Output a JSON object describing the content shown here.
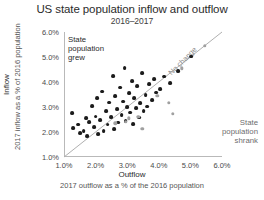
{
  "chart_data": {
    "type": "scatter",
    "title": "US state population inflow and outflow",
    "subtitle": "2016–2017",
    "xlabel": "Outflow",
    "xlabel_sub": "2017 outflow as a % of the 2016 population",
    "ylabel": "Inflow",
    "ylabel_sub": "2017 inflow as a % of 2016 population",
    "xlim": [
      1.0,
      6.0
    ],
    "ylim": [
      1.0,
      6.0
    ],
    "xticks": [
      "1.0%",
      "2.0%",
      "3.0%",
      "4.0%",
      "5.0%",
      "6.0%"
    ],
    "yticks": [
      "1.0%",
      "2.0%",
      "3.0%",
      "4.0%",
      "5.0%",
      "6.0%"
    ],
    "xtick_values": [
      1.0,
      2.0,
      3.0,
      4.0,
      5.0,
      6.0
    ],
    "ytick_values": [
      1.0,
      2.0,
      3.0,
      4.0,
      5.0,
      6.0
    ],
    "grid": false,
    "legend": "none",
    "annotations": [
      {
        "name": "grew",
        "text": "State\npopulation\ngrew",
        "position": "upper-left"
      },
      {
        "name": "shrank",
        "text": "State\npopulation\nshrank",
        "position": "lower-right"
      },
      {
        "name": "no-change",
        "text": "No change",
        "position": "diagonal"
      }
    ],
    "reference_line": {
      "label": "No change",
      "from": [
        1.0,
        1.0
      ],
      "to": [
        6.0,
        6.0
      ],
      "color": "#b0b0b0"
    },
    "series": [
      {
        "name": "State population grew",
        "color": "#1b1b1b",
        "points": [
          [
            1.25,
            2.75
          ],
          [
            1.3,
            2.15
          ],
          [
            1.45,
            2.3
          ],
          [
            1.5,
            1.95
          ],
          [
            1.62,
            2.05
          ],
          [
            1.7,
            2.55
          ],
          [
            1.72,
            1.85
          ],
          [
            1.8,
            2.4
          ],
          [
            1.88,
            3.05
          ],
          [
            1.95,
            2.2
          ],
          [
            2.0,
            2.62
          ],
          [
            2.05,
            3.35
          ],
          [
            2.08,
            1.92
          ],
          [
            2.15,
            2.48
          ],
          [
            2.2,
            3.62
          ],
          [
            2.25,
            2.05
          ],
          [
            2.32,
            2.85
          ],
          [
            2.38,
            2.3
          ],
          [
            2.42,
            3.18
          ],
          [
            2.48,
            2.6
          ],
          [
            2.55,
            4.25
          ],
          [
            2.58,
            2.12
          ],
          [
            2.62,
            3.45
          ],
          [
            2.68,
            2.92
          ],
          [
            2.72,
            2.38
          ],
          [
            2.78,
            3.78
          ],
          [
            2.82,
            2.68
          ],
          [
            2.88,
            3.22
          ],
          [
            2.92,
            4.55
          ],
          [
            2.95,
            2.45
          ],
          [
            3.0,
            3.0
          ],
          [
            3.05,
            3.55
          ],
          [
            3.1,
            2.78
          ],
          [
            3.15,
            4.05
          ],
          [
            3.18,
            2.32
          ],
          [
            3.22,
            3.35
          ],
          [
            3.28,
            2.95
          ],
          [
            3.32,
            3.85
          ],
          [
            3.38,
            2.58
          ],
          [
            3.42,
            3.15
          ],
          [
            3.48,
            4.35
          ],
          [
            3.52,
            2.85
          ],
          [
            3.58,
            3.48
          ],
          [
            3.62,
            3.02
          ],
          [
            3.7,
            3.92
          ],
          [
            3.78,
            3.28
          ],
          [
            3.85,
            4.12
          ],
          [
            3.92,
            3.58
          ],
          [
            4.05,
            3.72
          ],
          [
            4.18,
            4.22
          ],
          [
            4.35,
            3.95
          ],
          [
            4.62,
            4.45
          ],
          [
            5.02,
            5.02
          ]
        ]
      },
      {
        "name": "State population shrank",
        "color": "#a0a0a0",
        "points": [
          [
            2.62,
            2.35
          ],
          [
            2.95,
            2.42
          ],
          [
            3.05,
            2.55
          ],
          [
            3.35,
            2.62
          ],
          [
            3.48,
            2.12
          ],
          [
            3.95,
            3.45
          ],
          [
            4.32,
            3.18
          ],
          [
            4.45,
            2.72
          ],
          [
            4.72,
            4.55
          ],
          [
            5.45,
            5.45
          ]
        ]
      }
    ]
  }
}
